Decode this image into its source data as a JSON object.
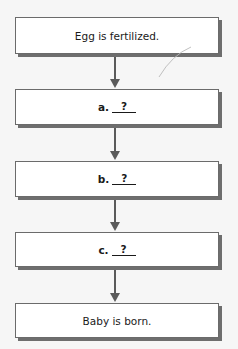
{
  "flowchart": {
    "steps": [
      {
        "type": "text",
        "text": "Egg is fertilized."
      },
      {
        "type": "blank",
        "letter": "a.",
        "blank": "?"
      },
      {
        "type": "blank",
        "letter": "b.",
        "blank": "?"
      },
      {
        "type": "blank",
        "letter": "c.",
        "blank": "?"
      },
      {
        "type": "text",
        "text": "Baby is born."
      }
    ],
    "colors": {
      "background": "#f6f6f6",
      "box_fill": "#ffffff",
      "box_border": "#6b6b6b",
      "shadow": "#6e6e6e",
      "arrow": "#5a5a5a"
    }
  }
}
